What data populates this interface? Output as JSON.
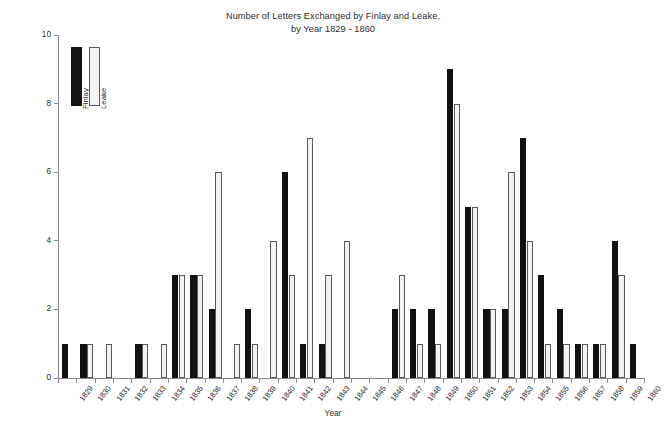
{
  "chart_data": {
    "type": "bar",
    "title": "Number of Letters Exchanged by Finlay and Leake, by Year 1829 - 1860",
    "title_line1": "Number of Letters Exchanged by Finlay and Leake,",
    "title_line2": "by Year 1829 - 1860",
    "xlabel": "Year",
    "ylabel": "Number of letters",
    "ylim": [
      0,
      10
    ],
    "yticks": [
      0,
      2,
      4,
      6,
      8,
      10
    ],
    "grid": false,
    "legend_position": "top-left-inside",
    "categories": [
      "1829",
      "1830",
      "1831",
      "1832",
      "1833",
      "1834",
      "1835",
      "1836",
      "1837",
      "1838",
      "1839",
      "1840",
      "1841",
      "1842",
      "1843",
      "1844",
      "1845",
      "1846",
      "1847",
      "1848",
      "1849",
      "1850",
      "1851",
      "1852",
      "1853",
      "1854",
      "1855",
      "1856",
      "1857",
      "1858",
      "1859",
      "1860"
    ],
    "series": [
      {
        "name": "Finlay",
        "color": "#121212",
        "values": [
          1,
          1,
          0,
          0,
          1,
          0,
          3,
          3,
          2,
          0,
          2,
          0,
          6,
          1,
          1,
          0,
          0,
          0,
          2,
          2,
          2,
          9,
          5,
          2,
          2,
          7,
          3,
          2,
          1,
          1,
          4,
          1
        ]
      },
      {
        "name": "Leake",
        "color": "#f2f2f2",
        "values": [
          0,
          1,
          1,
          0,
          1,
          1,
          3,
          3,
          6,
          1,
          1,
          4,
          3,
          7,
          3,
          4,
          0,
          0,
          3,
          1,
          1,
          8,
          5,
          2,
          6,
          4,
          1,
          1,
          1,
          1,
          3,
          0
        ]
      }
    ]
  },
  "legend": {
    "items": [
      {
        "label": "Finlay",
        "swatch": "black-bar-swatch"
      },
      {
        "label": "Leake",
        "swatch": "white-bar-swatch"
      }
    ]
  }
}
